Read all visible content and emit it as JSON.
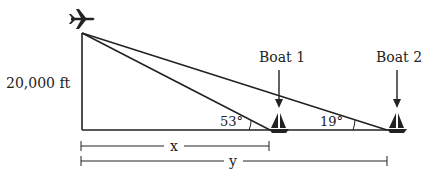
{
  "diagram": {
    "altitude_label": "20,000 ft",
    "boats": [
      {
        "label": "Boat 1",
        "angle_label": "53°"
      },
      {
        "label": "Boat 2",
        "angle_label": "19°"
      }
    ],
    "distances": [
      {
        "label": "x"
      },
      {
        "label": "y"
      }
    ],
    "colors": {
      "stroke": "#222222",
      "background": "#ffffff"
    }
  }
}
